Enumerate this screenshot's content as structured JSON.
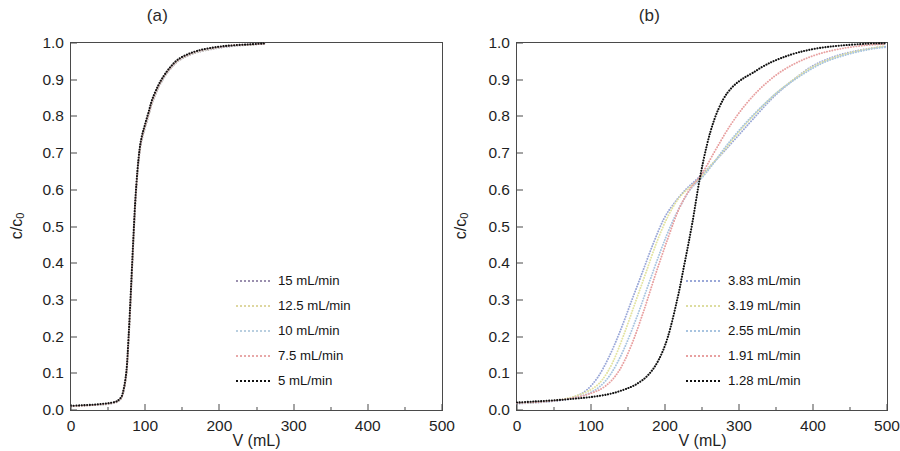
{
  "figure": {
    "panels": [
      {
        "id": "a",
        "title": "(a)",
        "xlabel": "V (mL)",
        "ylabel_main": "c/c",
        "ylabel_sub": "0"
      },
      {
        "id": "b",
        "title": "(b)",
        "xlabel": "V (mL)",
        "ylabel_main": "c/c",
        "ylabel_sub": "0"
      }
    ],
    "axis": {
      "x_ticks": [
        "0",
        "100",
        "200",
        "300",
        "400",
        "500"
      ],
      "y_ticks": [
        "0.0",
        "0.1",
        "0.2",
        "0.3",
        "0.4",
        "0.5",
        "0.6",
        "0.7",
        "0.8",
        "0.9",
        "1.0"
      ]
    }
  },
  "chart_data": [
    {
      "type": "line",
      "panel": "a",
      "title": "(a)",
      "xlabel": "V (mL)",
      "ylabel": "c/c0",
      "xlim": [
        0,
        500
      ],
      "ylim": [
        0,
        1
      ],
      "xticks": [
        0,
        100,
        200,
        300,
        400,
        500
      ],
      "yticks": [
        0.0,
        0.1,
        0.2,
        0.3,
        0.4,
        0.5,
        0.6,
        0.7,
        0.8,
        0.9,
        1.0
      ],
      "x_minor_tick_step": 50,
      "grid": false,
      "legend_position": "center-right",
      "linestyle": "dotted",
      "series": [
        {
          "name": "15 mL/min",
          "color": "#9a8fae",
          "x": [
            0,
            10,
            20,
            30,
            40,
            50,
            60,
            65,
            70,
            75,
            78,
            81,
            84,
            87,
            90,
            93,
            96,
            100,
            105,
            110,
            118,
            126,
            135,
            145,
            158,
            172,
            188,
            205,
            222,
            240,
            255,
            262
          ],
          "y": [
            0.005,
            0.006,
            0.007,
            0.008,
            0.009,
            0.011,
            0.015,
            0.02,
            0.035,
            0.09,
            0.18,
            0.3,
            0.43,
            0.55,
            0.64,
            0.7,
            0.735,
            0.765,
            0.8,
            0.835,
            0.875,
            0.905,
            0.93,
            0.95,
            0.965,
            0.975,
            0.982,
            0.988,
            0.992,
            0.995,
            0.997,
            0.998
          ]
        },
        {
          "name": "12.5 mL/min",
          "color": "#e8e0a8",
          "x": [
            0,
            10,
            20,
            30,
            40,
            50,
            60,
            65,
            70,
            75,
            78,
            81,
            84,
            87,
            90,
            93,
            96,
            100,
            105,
            110,
            118,
            126,
            135,
            145,
            158,
            172,
            188,
            205,
            222,
            240,
            255,
            262
          ],
          "y": [
            0.005,
            0.006,
            0.007,
            0.008,
            0.009,
            0.011,
            0.015,
            0.02,
            0.036,
            0.092,
            0.183,
            0.303,
            0.433,
            0.553,
            0.642,
            0.702,
            0.737,
            0.767,
            0.802,
            0.837,
            0.877,
            0.906,
            0.931,
            0.951,
            0.966,
            0.976,
            0.983,
            0.989,
            0.993,
            0.995,
            0.997,
            0.998
          ]
        },
        {
          "name": "10 mL/min",
          "color": "#b9cfe0",
          "x": [
            0,
            10,
            20,
            30,
            40,
            50,
            60,
            65,
            70,
            75,
            78,
            81,
            84,
            87,
            90,
            93,
            96,
            100,
            105,
            110,
            118,
            126,
            135,
            145,
            158,
            172,
            188,
            205,
            222,
            240,
            255,
            262
          ],
          "y": [
            0.005,
            0.006,
            0.007,
            0.008,
            0.009,
            0.011,
            0.015,
            0.021,
            0.037,
            0.094,
            0.186,
            0.306,
            0.436,
            0.556,
            0.644,
            0.704,
            0.739,
            0.769,
            0.804,
            0.839,
            0.878,
            0.907,
            0.932,
            0.952,
            0.967,
            0.977,
            0.984,
            0.989,
            0.993,
            0.996,
            0.997,
            0.998
          ]
        },
        {
          "name": "7.5 mL/min",
          "color": "#e8a8a8",
          "x": [
            0,
            10,
            20,
            30,
            40,
            50,
            60,
            65,
            70,
            75,
            78,
            81,
            84,
            87,
            90,
            93,
            96,
            100,
            105,
            110,
            118,
            126,
            135,
            145,
            158,
            172,
            188,
            205,
            222,
            240,
            255,
            262
          ],
          "y": [
            0.005,
            0.006,
            0.007,
            0.008,
            0.01,
            0.012,
            0.016,
            0.022,
            0.038,
            0.096,
            0.19,
            0.31,
            0.44,
            0.56,
            0.647,
            0.706,
            0.741,
            0.771,
            0.806,
            0.841,
            0.88,
            0.909,
            0.933,
            0.953,
            0.968,
            0.978,
            0.985,
            0.99,
            0.994,
            0.996,
            0.997,
            0.998
          ]
        },
        {
          "name": "5 mL/min",
          "color": "#111111",
          "x": [
            0,
            10,
            20,
            30,
            40,
            50,
            60,
            65,
            70,
            75,
            78,
            81,
            84,
            87,
            90,
            93,
            96,
            100,
            105,
            110,
            118,
            126,
            135,
            145,
            158,
            172,
            188,
            205,
            222,
            240,
            255,
            262
          ],
          "y": [
            0.006,
            0.007,
            0.008,
            0.009,
            0.011,
            0.013,
            0.017,
            0.023,
            0.04,
            0.1,
            0.195,
            0.315,
            0.445,
            0.565,
            0.65,
            0.71,
            0.745,
            0.775,
            0.81,
            0.845,
            0.883,
            0.911,
            0.935,
            0.955,
            0.969,
            0.979,
            0.986,
            0.991,
            0.994,
            0.996,
            0.998,
            0.999
          ]
        }
      ]
    },
    {
      "type": "line",
      "panel": "b",
      "title": "(b)",
      "xlabel": "V (mL)",
      "ylabel": "c/c0",
      "xlim": [
        0,
        500
      ],
      "ylim": [
        0,
        1
      ],
      "xticks": [
        0,
        100,
        200,
        300,
        400,
        500
      ],
      "yticks": [
        0.0,
        0.1,
        0.2,
        0.3,
        0.4,
        0.5,
        0.6,
        0.7,
        0.8,
        0.9,
        1.0
      ],
      "x_minor_tick_step": 50,
      "grid": false,
      "legend_position": "center-right",
      "linestyle": "dotted",
      "crossover_point": {
        "x": 245,
        "y": 0.62
      },
      "series": [
        {
          "name": "3.83 mL/min",
          "color": "#9aa8d8",
          "x": [
            0,
            20,
            40,
            60,
            80,
            95,
            110,
            125,
            140,
            155,
            170,
            185,
            200,
            215,
            230,
            245,
            262,
            280,
            300,
            320,
            345,
            370,
            400,
            430,
            460,
            490,
            500
          ],
          "y": [
            0.012,
            0.014,
            0.017,
            0.022,
            0.032,
            0.05,
            0.085,
            0.14,
            0.21,
            0.29,
            0.37,
            0.45,
            0.52,
            0.565,
            0.6,
            0.628,
            0.662,
            0.7,
            0.745,
            0.79,
            0.845,
            0.89,
            0.935,
            0.962,
            0.978,
            0.988,
            0.99
          ]
        },
        {
          "name": "3.19 mL/min",
          "color": "#e3e3a0",
          "x": [
            0,
            20,
            40,
            60,
            80,
            100,
            115,
            130,
            145,
            160,
            175,
            190,
            205,
            220,
            235,
            248,
            265,
            285,
            305,
            328,
            352,
            378,
            405,
            435,
            465,
            495,
            500
          ],
          "y": [
            0.013,
            0.015,
            0.018,
            0.023,
            0.033,
            0.05,
            0.075,
            0.125,
            0.2,
            0.285,
            0.37,
            0.455,
            0.525,
            0.575,
            0.605,
            0.628,
            0.668,
            0.715,
            0.765,
            0.815,
            0.862,
            0.903,
            0.938,
            0.963,
            0.979,
            0.99,
            0.991
          ]
        },
        {
          "name": "2.55 mL/min",
          "color": "#a8c4e0",
          "x": [
            0,
            25,
            50,
            75,
            95,
            112,
            128,
            145,
            162,
            178,
            195,
            210,
            225,
            238,
            250,
            265,
            285,
            308,
            332,
            358,
            385,
            415,
            448,
            480,
            500
          ],
          "y": [
            0.013,
            0.016,
            0.019,
            0.026,
            0.038,
            0.058,
            0.095,
            0.16,
            0.245,
            0.335,
            0.43,
            0.505,
            0.565,
            0.605,
            0.628,
            0.665,
            0.72,
            0.775,
            0.825,
            0.872,
            0.91,
            0.945,
            0.968,
            0.983,
            0.988
          ]
        },
        {
          "name": "1.91 mL/min",
          "color": "#e8a0a0",
          "x": [
            0,
            25,
            50,
            75,
            100,
            120,
            138,
            155,
            172,
            188,
            205,
            220,
            235,
            248,
            258,
            272,
            290,
            310,
            332,
            356,
            382,
            410,
            442,
            475,
            500
          ],
          "y": [
            0.014,
            0.016,
            0.02,
            0.027,
            0.04,
            0.06,
            0.1,
            0.17,
            0.265,
            0.365,
            0.465,
            0.545,
            0.6,
            0.632,
            0.665,
            0.715,
            0.775,
            0.83,
            0.878,
            0.918,
            0.948,
            0.97,
            0.985,
            0.994,
            0.997
          ]
        },
        {
          "name": "1.28 mL/min",
          "color": "#111111",
          "x": [
            0,
            25,
            50,
            75,
            100,
            125,
            145,
            162,
            178,
            192,
            205,
            218,
            228,
            238,
            248,
            258,
            268,
            280,
            292,
            305,
            320,
            338,
            358,
            382,
            410,
            440,
            475,
            500
          ],
          "y": [
            0.015,
            0.018,
            0.021,
            0.025,
            0.03,
            0.038,
            0.05,
            0.065,
            0.09,
            0.13,
            0.195,
            0.3,
            0.4,
            0.505,
            0.625,
            0.72,
            0.79,
            0.845,
            0.878,
            0.9,
            0.918,
            0.94,
            0.958,
            0.974,
            0.986,
            0.993,
            0.998,
            0.999
          ]
        }
      ]
    }
  ],
  "legend_a": {
    "items": [
      {
        "label": "15 mL/min",
        "color": "#9a8fae"
      },
      {
        "label": "12.5 mL/min",
        "color": "#ded7a0"
      },
      {
        "label": "10 mL/min",
        "color": "#b9cfe0"
      },
      {
        "label": "7.5 mL/min",
        "color": "#e8a8a8"
      },
      {
        "label": "5 mL/min",
        "color": "#111111"
      }
    ]
  },
  "legend_b": {
    "items": [
      {
        "label": "3.83 mL/min",
        "color": "#9aa8d8"
      },
      {
        "label": "3.19 mL/min",
        "color": "#ddddA0"
      },
      {
        "label": "2.55 mL/min",
        "color": "#a8c4e0"
      },
      {
        "label": "1.91 mL/min",
        "color": "#e8a0a0"
      },
      {
        "label": "1.28 mL/min",
        "color": "#111111"
      }
    ]
  }
}
